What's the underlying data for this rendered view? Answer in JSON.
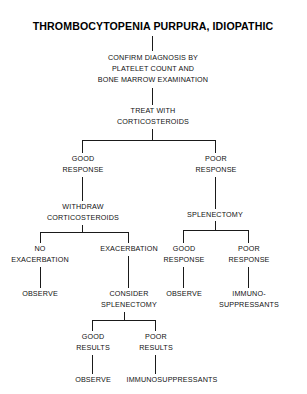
{
  "diagram": {
    "title": "THROMBOCYTOPENIA PURPURA, IDIOPATHIC",
    "nodes": {
      "confirm_1": "CONFIRM DIAGNOSIS BY",
      "confirm_2": "PLATELET COUNT AND",
      "confirm_3": "BONE MARROW EXAMINATION",
      "treat_1": "TREAT WITH",
      "treat_2": "CORTICOSTEROIDS",
      "good_response_1_1": "GOOD",
      "good_response_1_2": "RESPONSE",
      "poor_response_1_1": "POOR",
      "poor_response_1_2": "RESPONSE",
      "withdraw_1": "WITHDRAW",
      "withdraw_2": "CORTICOSTEROIDS",
      "splenectomy": "SPLENECTOMY",
      "no_exacerbation_1": "NO",
      "no_exacerbation_2": "EXACERBATION",
      "exacerbation": "EXACERBATION",
      "observe_left": "OBSERVE",
      "consider_1": "CONSIDER",
      "consider_2": "SPLENECTOMY",
      "good_response_2_1": "GOOD",
      "good_response_2_2": "RESPONSE",
      "poor_response_2_1": "POOR",
      "poor_response_2_2": "RESPONSE",
      "observe_right": "OBSERVE",
      "immuno_right_1": "IMMUNO-",
      "immuno_right_2": "SUPPRESSANTS",
      "good_results_1": "GOOD",
      "good_results_2": "RESULTS",
      "poor_results_1": "POOR",
      "poor_results_2": "RESULTS",
      "observe_bottom": "OBSERVE",
      "immunosuppressants_bottom": "IMMUNOSUPPRESSANTS"
    },
    "colors": {
      "background": "#ffffff",
      "text": "#111111",
      "line": "#1a1a1a"
    }
  }
}
